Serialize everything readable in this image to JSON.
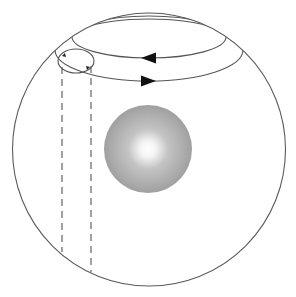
{
  "diagram": {
    "colors": {
      "background": "#ffffff",
      "stroke": "#555555",
      "arrow": "#111111",
      "core_outer": "#a6a6a6",
      "core_inner": "#ffffff"
    },
    "outer_sphere": {
      "cx": 149,
      "cy": 149.5,
      "r": 136.5
    },
    "core": {
      "cx": 148,
      "cy": 149,
      "r": 44
    },
    "upper_orbit": {
      "cx": 149,
      "cy": 37,
      "rx": 77,
      "ry": 21,
      "arrow_direction": "left",
      "arrow_at": [
        148,
        58
      ]
    },
    "lower_orbit": {
      "cx": 149,
      "cy": 50,
      "rx": 94,
      "ry": 31,
      "arrow_direction": "right",
      "arrow_at": [
        148,
        81
      ]
    },
    "small_loop": {
      "cx": 76,
      "cy": 61,
      "rx": 18,
      "ry": 12
    },
    "dashed_lines": [
      {
        "x": 62,
        "y1": 67,
        "y2": 252
      },
      {
        "x": 91,
        "y1": 66,
        "y2": 272
      }
    ]
  }
}
